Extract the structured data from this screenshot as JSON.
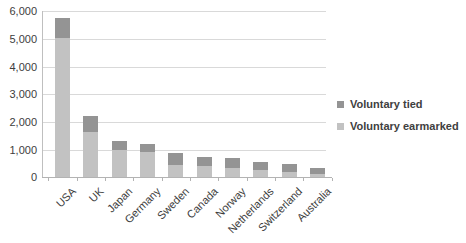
{
  "chart_data": {
    "type": "bar",
    "stacked": true,
    "title": "",
    "xlabel": "",
    "ylabel": "",
    "categories": [
      "USA",
      "UK",
      "Japan",
      "Germany",
      "Sweden",
      "Canada",
      "Norway",
      "Netherlands",
      "Switzerland",
      "Australia"
    ],
    "series": [
      {
        "name": "Voluntary earmarked",
        "color": "#c2c2c2",
        "values": [
          5050,
          1650,
          1000,
          900,
          450,
          410,
          340,
          280,
          190,
          140
        ]
      },
      {
        "name": "Voluntary tied",
        "color": "#949494",
        "values": [
          700,
          570,
          300,
          300,
          420,
          340,
          350,
          270,
          290,
          200
        ]
      }
    ],
    "totals": [
      5750,
      2220,
      1300,
      1200,
      870,
      750,
      690,
      550,
      480,
      340
    ],
    "ylim": [
      0,
      6000
    ],
    "ytick_step": 1000,
    "ytick_labels": [
      "0",
      "1,000",
      "2,000",
      "3,000",
      "4,000",
      "5,000",
      "6,000"
    ],
    "grid": true,
    "legend_position": "right-middle",
    "legend_order": [
      "Voluntary tied",
      "Voluntary earmarked"
    ]
  },
  "colors": {
    "background": "#ffffff",
    "gridline": "#d9d9d9",
    "axis_line": "#bfbfbf",
    "tick_text": "#3d3d3d",
    "legend_text": "#404040"
  }
}
